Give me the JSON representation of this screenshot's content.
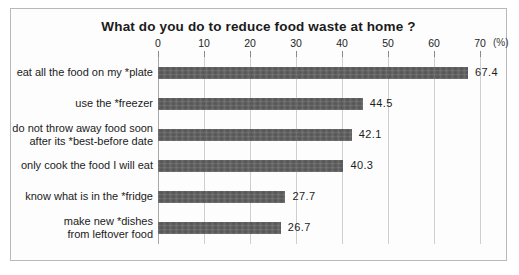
{
  "chart_data": {
    "type": "bar",
    "orientation": "horizontal",
    "title": "What do you do to reduce food waste at home ?",
    "xlabel": "",
    "ylabel": "",
    "unit_label": "(%)",
    "xlim": [
      0,
      70
    ],
    "xticks": [
      0,
      10,
      20,
      30,
      40,
      50,
      60,
      70
    ],
    "xtick_labels": [
      "0",
      "10",
      "20",
      "30",
      "40",
      "50",
      "60",
      "70"
    ],
    "grid": true,
    "legend": "none",
    "bar_color": "#5d5d5d",
    "categories": [
      "eat all the food on my *plate",
      "use the *freezer",
      "do not throw away food soon after its *best-before date",
      "only cook the food I will eat",
      "know what is in the *fridge",
      "make new *dishes from leftover food"
    ],
    "category_lines": [
      [
        "eat all the food on my *plate"
      ],
      [
        "use the *freezer"
      ],
      [
        "do not throw away food soon",
        "after its *best-before date"
      ],
      [
        "only cook the food I will eat"
      ],
      [
        "know what is in the *fridge"
      ],
      [
        "make new *dishes",
        "from leftover food"
      ]
    ],
    "values": [
      67.4,
      44.5,
      42.1,
      40.3,
      27.7,
      26.7
    ],
    "value_labels": [
      "67.4",
      "44.5",
      "42.1",
      "40.3",
      "27.7",
      "26.7"
    ]
  }
}
